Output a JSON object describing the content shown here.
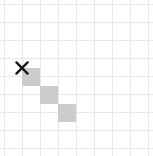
{
  "figure": {
    "title": "",
    "background_color": "#ffffff"
  },
  "grid": {
    "columns": 8,
    "rows": 8,
    "cell_size_px": 18,
    "origin_x_px": 4,
    "origin_y_px": 4,
    "line_color": "#e8e8e8",
    "line_width_px": 1,
    "vertical_line_x": [
      4,
      22,
      40,
      58,
      76,
      94,
      112,
      130,
      148
    ],
    "horizontal_line_y": [
      4,
      22,
      40,
      58,
      76,
      94,
      112,
      130,
      148
    ]
  },
  "cells": {
    "fill_color": "#cccccc",
    "filled": [
      {
        "col": 1,
        "row": 3,
        "x": 22,
        "y": 68,
        "w": 18,
        "h": 18
      },
      {
        "col": 2,
        "row": 4,
        "x": 40,
        "y": 86,
        "w": 18,
        "h": 18
      },
      {
        "col": 3,
        "row": 5,
        "x": 58,
        "y": 104,
        "w": 18,
        "h": 18
      }
    ]
  },
  "markers": [
    {
      "type": "x-marker",
      "label": "X",
      "color": "#1a1a1a",
      "x": 22,
      "y": 68,
      "size_px": 16,
      "stroke_width_px": 2.4
    }
  ]
}
